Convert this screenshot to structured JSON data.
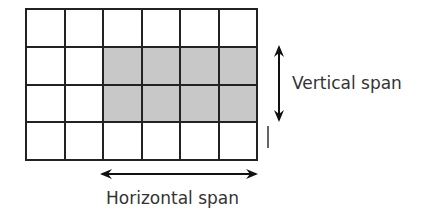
{
  "diagram": {
    "grid": {
      "columns": 6,
      "rows": 4,
      "shaded": {
        "row_start": 1,
        "row_end": 2,
        "col_start": 2,
        "col_end": 5
      }
    },
    "colors": {
      "line": "#222222",
      "shaded": "#c8c8c8",
      "empty": "#ffffff",
      "text": "#333333"
    },
    "labels": {
      "vertical": "Vertical span",
      "horizontal": "Horizontal span"
    }
  }
}
